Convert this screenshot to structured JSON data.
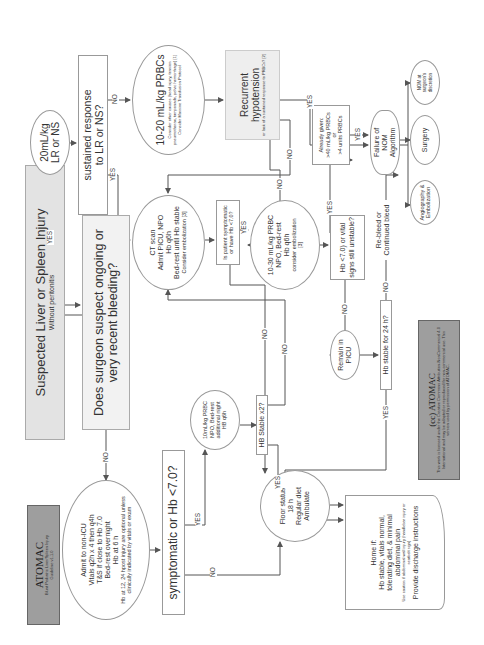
{
  "nodes": {
    "atomac": {
      "title": "ATOMAC",
      "sub1": "Blunt Pediatric Liver/Spleen Injury",
      "sub2": "Guideline v1.1.0"
    },
    "suspected": {
      "title": "Suspected Liver or Spleen Injury",
      "sub": "Without peritonitis"
    },
    "surgeon_q": {
      "text": "Does surgeon suspect ongoing or very recent bleeding?"
    },
    "fluid": {
      "line1": "20mL/kg",
      "line2": "LR or NS"
    },
    "sustained_q": {
      "line1": "sustained response",
      "line2": "to LR or NS?"
    },
    "prbc_10_20": {
      "title": "10-20 mL/kg PRBCs",
      "note": "Consider other causes (head injury, tension pneumothorax, tamponade, pelvic hemorrhage) [1]",
      "note2": "Consider Massive Transfusion Protocol"
    },
    "recurrent": {
      "title": "Recurrent hypotension",
      "note": "or lack of a sustained response to PRBCs? [2]"
    },
    "admit_non_icu": {
      "l1": "Admit to non-ICU",
      "l2": "Vitals q2h x 4 then q4h",
      "l3": "T&S if close to Hb 7.0",
      "l4": "Bed-rest overnight",
      "l5": "Hb at 6 h",
      "note": "Hb at 12, 24 hpost injury are optional unless clinically indicated by vitals or exam"
    },
    "symptomatic_q": {
      "text": "symptomatic or  Hb <7.0?"
    },
    "ct_scan": {
      "l1": "CT scan",
      "l2": "Admit PICU, NPO",
      "l3": "Hb q6h",
      "l4": "Bed-rest until Hb stable",
      "l5": "Consider embolization [3]"
    },
    "prbc_10": {
      "l1": "10mL/kg PRBC",
      "l2": "NPO, Bed-rest",
      "l3": "additional night",
      "l4": "HB q6h"
    },
    "hb_stable_x2": {
      "text": "HB Stable x2?"
    },
    "floor": {
      "l1": "Floor status",
      "l2": "18 h",
      "l3": "Regular diet",
      "l4": "Ambulate"
    },
    "home": {
      "l1": "Home if:",
      "l2": "Hb stable, vitals normal,",
      "l3": "tolerating diet, & minimal",
      "l4": "abdominal pain",
      "note": "Use caution if abdominal wall injury (handlebar injury or seatbelt sign)",
      "l5": "Provide discharge instructions"
    },
    "is_patient_q": {
      "l1": "Is patient symptomatic",
      "l2": "or have Hb <7.0?"
    },
    "prbc_10_30": {
      "l1": "10-30 mL/kg PRBC",
      "l2": "NPO, Bed-rest",
      "l3": "Hb q6h",
      "l4": "consider embolization",
      "l5": "[3]"
    },
    "hb_unstable_q": {
      "l1": "Hb <7.0) or vital",
      "l2": "signs still unstable?"
    },
    "already_given": {
      "l1": "Already given:",
      "l2": ">40 mL/kg PRBCs",
      "l3": "or",
      "l4": ">4 units PRBCs"
    },
    "failure_nom": {
      "l1": "Failure of",
      "l2": "NOM",
      "l3": "Algorithm"
    },
    "remain_picu": {
      "l1": "Remain in",
      "l2": "PICU"
    },
    "hb_stable_24": {
      "text": "Hb stable for 24 h?"
    },
    "rebleed": {
      "l1": "Re-bleed or",
      "l2": "Continued bleed"
    },
    "copyright": {
      "title": "(cc)  ATOMAC",
      "text": "This work is licensed under the Creative Commons Attribution-NonCommercial 4.0 International and may be adapted or reproduced for non-commercial use. This version used by permission of ATOMAC."
    },
    "angio": {
      "l1": "Angiography &",
      "l2": "Embolization"
    },
    "surgery": {
      "text": "Surgery"
    },
    "nom_discretion": {
      "l1": "NOM at",
      "l2": "surgeon's",
      "l3": "discretion"
    }
  },
  "edge_labels": {
    "yes": "YES",
    "no": "NO"
  },
  "colors": {
    "line": "#555555",
    "box_border": "#999999",
    "gray_fill": "#e3e3e3",
    "dark_fill": "#9e9e9e"
  }
}
